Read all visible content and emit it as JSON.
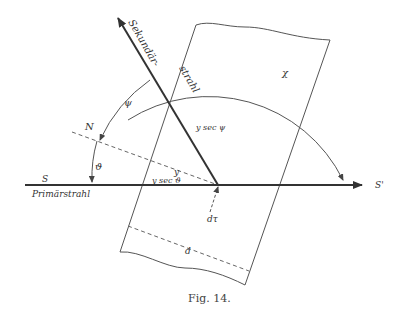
{
  "figure": {
    "caption": "Fig. 14.",
    "labels": {
      "secondary_ray": "Sekundär-strahl",
      "secondary_ray_part1": "Sekundär-",
      "secondary_ray_part2": "strahl",
      "primary_ray": "Primärstrahl",
      "S": "S",
      "S_prime": "S'",
      "N": "N",
      "psi": "ψ",
      "chi": "χ",
      "theta": "ϑ",
      "y": "y",
      "y_sec_psi": "y sec ψ",
      "y_sec_theta": "y sec ϑ",
      "d_tau": "dτ",
      "d": "d"
    }
  }
}
